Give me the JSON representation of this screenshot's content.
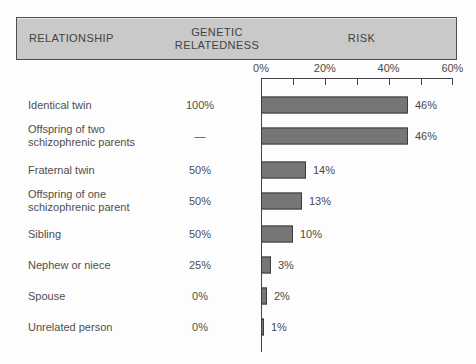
{
  "header": {
    "columns": [
      "RELATIONSHIP",
      "GENETIC RELATEDNESS",
      "RISK"
    ]
  },
  "chart_data": {
    "type": "bar",
    "orientation": "horizontal",
    "title": "",
    "xlabel": "RISK",
    "xlim": [
      0,
      60
    ],
    "x_minor_ticks_pct": [
      0,
      10,
      20,
      30,
      40,
      50,
      60
    ],
    "x_tick_labels": [
      {
        "pct": 0,
        "label": "0%"
      },
      {
        "pct": 20,
        "label": "20%"
      },
      {
        "pct": 40,
        "label": "40%"
      },
      {
        "pct": 60,
        "label": "60%"
      }
    ],
    "grid": false,
    "legend": "none",
    "rows": [
      {
        "relationship": "Identical twin",
        "relatedness": "100%",
        "risk_pct": 46,
        "risk_label": "46%"
      },
      {
        "relationship": "Offspring of two schizophrenic parents",
        "relatedness": "—",
        "risk_pct": 46,
        "risk_label": "46%"
      },
      {
        "relationship": "Fraternal twin",
        "relatedness": "50%",
        "risk_pct": 14,
        "risk_label": "14%"
      },
      {
        "relationship": "Offspring of one schizophrenic parent",
        "relatedness": "50%",
        "risk_pct": 13,
        "risk_label": "13%"
      },
      {
        "relationship": "Sibling",
        "relatedness": "50%",
        "risk_pct": 10,
        "risk_label": "10%"
      },
      {
        "relationship": "Nephew or niece",
        "relatedness": "25%",
        "risk_pct": 3,
        "risk_label": "3%"
      },
      {
        "relationship": "Spouse",
        "relatedness": "0%",
        "risk_pct": 2,
        "risk_label": "2%"
      },
      {
        "relationship": "Unrelated person",
        "relatedness": "0%",
        "risk_pct": 1,
        "risk_label": "1%"
      }
    ]
  },
  "colors": {
    "background": "#fdfdfd",
    "bar_fill": "#767676",
    "bar_border": "#3d3d3d",
    "header_fill": "#c9c9c9",
    "header_border": "#4d4d4d",
    "axis": "#474747",
    "text": "#4c4c4c"
  }
}
